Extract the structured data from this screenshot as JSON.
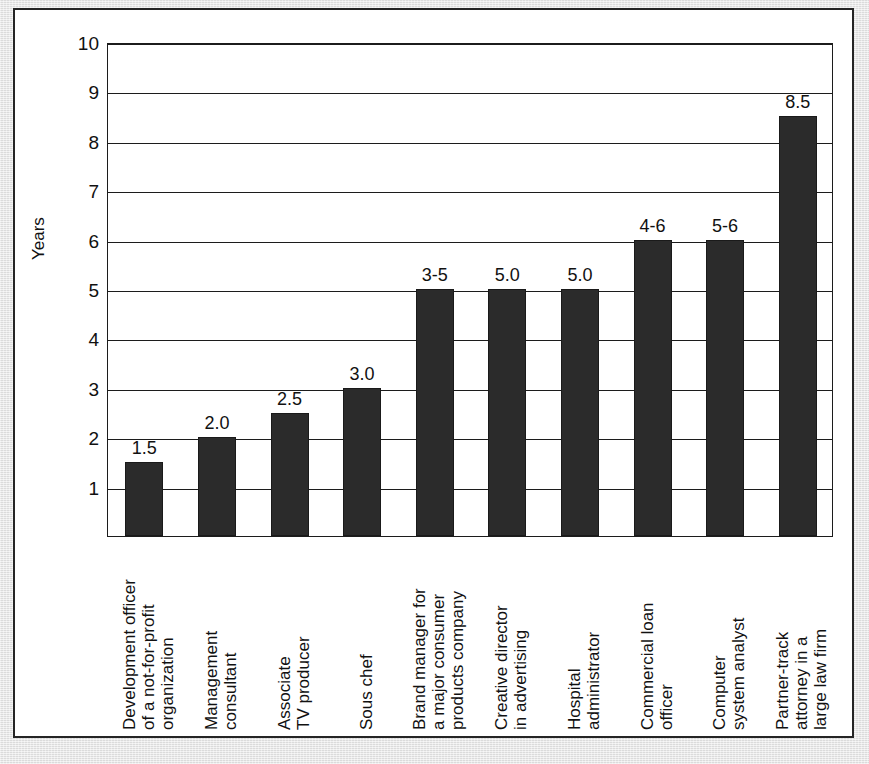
{
  "figure": {
    "clipped_caption": "",
    "frame_color": "#252525",
    "page_background": "#e4e4e4"
  },
  "chart_data": {
    "type": "bar",
    "title": "",
    "subtitle": "",
    "xlabel": "",
    "ylabel": "Years",
    "ylim": [
      0,
      10
    ],
    "yticks": [
      1,
      2,
      3,
      4,
      5,
      6,
      7,
      8,
      9,
      10
    ],
    "ytick_labels": [
      "1",
      "2",
      "3",
      "4",
      "5",
      "6",
      "7",
      "8",
      "9",
      "10"
    ],
    "grid": true,
    "legend": null,
    "bar_color": "#2b2b2b",
    "categories": [
      "Development officer of a not-for-profit organization",
      "Management consultant",
      "Associate TV producer",
      "Sous chef",
      "Brand manager for a major consumer products company",
      "Creative director in advertising",
      "Hospital administrator",
      "Commercial loan officer",
      "Computer system analyst",
      "Partner-track attorney in a large law firm"
    ],
    "category_lines": [
      [
        "Development officer",
        "of a not-for-profit",
        "organization"
      ],
      [
        "Management",
        "consultant"
      ],
      [
        "Associate",
        "TV producer"
      ],
      [
        "Sous chef"
      ],
      [
        "Brand manager for",
        "a major consumer",
        "products company"
      ],
      [
        "Creative director",
        "in advertising"
      ],
      [
        "Hospital",
        "administrator"
      ],
      [
        "Commercial loan",
        "officer"
      ],
      [
        "Computer",
        "system analyst"
      ],
      [
        "Partner-track",
        "attorney in a",
        "large law firm"
      ]
    ],
    "values": [
      1.5,
      2.0,
      2.5,
      3.0,
      5.0,
      5.0,
      5.0,
      6.0,
      6.0,
      8.5
    ],
    "data_labels": [
      "1.5",
      "2.0",
      "2.5",
      "3.0",
      "3-5",
      "5.0",
      "5.0",
      "4-6",
      "5-6",
      "8.5"
    ]
  }
}
